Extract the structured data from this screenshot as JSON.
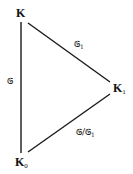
{
  "diagram": {
    "type": "field-extension-triangle",
    "nodes": [
      {
        "id": "K",
        "label": "K",
        "subscript": ""
      },
      {
        "id": "K1",
        "label": "K",
        "subscript": "1"
      },
      {
        "id": "K0",
        "label": "K",
        "subscript": "0"
      }
    ],
    "edges": [
      {
        "from": "K",
        "to": "K0",
        "label": "𝔊",
        "label_sub": ""
      },
      {
        "from": "K",
        "to": "K1",
        "label": "𝔊",
        "label_sub": "1"
      },
      {
        "from": "K1",
        "to": "K0",
        "label": "𝔊/𝔊",
        "label_sub": "1"
      }
    ]
  }
}
